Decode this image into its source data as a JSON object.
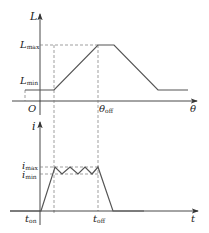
{
  "colors": {
    "axis": "#333333",
    "curve": "#555555",
    "dash": "#777777",
    "text": "#222222"
  },
  "top_plot": {
    "y_axis_label": "L",
    "x_axis_label": "θ",
    "origin_label": "O",
    "y_ticks": {
      "max": {
        "base": "L",
        "sub": "max"
      },
      "min": {
        "base": "L",
        "sub": "min"
      }
    },
    "x_ticks": {
      "off": {
        "base": "θ",
        "sub": "off"
      }
    }
  },
  "bottom_plot": {
    "y_axis_label": "i",
    "x_axis_label": "t",
    "y_ticks": {
      "max": {
        "base": "i",
        "sub": "max"
      },
      "min": {
        "base": "i",
        "sub": "min"
      }
    },
    "x_ticks": {
      "on": {
        "base": "t",
        "sub": "on"
      },
      "off": {
        "base": "t",
        "sub": "off"
      }
    }
  }
}
